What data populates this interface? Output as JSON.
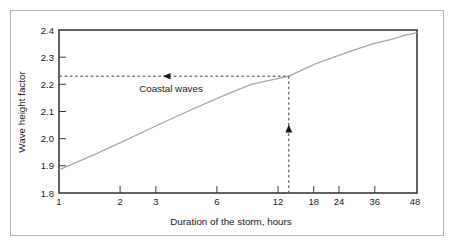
{
  "chart_data": {
    "type": "line",
    "title": "",
    "xlabel": "Duration of the storm, hours",
    "ylabel": "Wave height factor",
    "xscale": "log",
    "xlim": [
      1,
      48
    ],
    "ylim": [
      1.8,
      2.4
    ],
    "grid": false,
    "legend": null,
    "xticks": [
      1,
      2,
      3,
      6,
      12,
      18,
      24,
      36,
      48
    ],
    "xtick_labels": [
      "1",
      "2",
      "3",
      "6",
      "12",
      "18",
      "24",
      "36",
      "48"
    ],
    "yticks": [
      1.8,
      1.9,
      2.0,
      2.1,
      2.2,
      2.3,
      2.4
    ],
    "ytick_labels": [
      "1.8",
      "1.9",
      "2.0",
      "2.1",
      "2.2",
      "2.3",
      "2.4"
    ],
    "series": [
      {
        "name": "Coastal waves",
        "color": "#a8a8a8",
        "x": [
          1,
          1.5,
          2,
          3,
          4,
          6,
          8,
          12,
          16,
          18,
          24,
          30,
          36,
          42,
          48
        ],
        "y": [
          1.885,
          1.945,
          1.99,
          2.055,
          2.1,
          2.16,
          2.2,
          2.23,
          2.275,
          2.29,
          2.325,
          2.35,
          2.365,
          2.38,
          2.39
        ]
      }
    ],
    "annotations": [
      {
        "name": "coastal-waves-label",
        "text": "Coastal waves",
        "x": 3.1,
        "y": 2.195
      },
      {
        "name": "horizontal-guide",
        "style": "dashed-with-left-arrow",
        "y": 2.23,
        "x_from": 1,
        "x_to": 12
      },
      {
        "name": "vertical-guide",
        "style": "dashed-with-up-arrow",
        "x": 12,
        "y_from": 1.8,
        "y_to": 2.23
      }
    ],
    "readout": {
      "duration_hours": 12,
      "wave_height_factor": 2.23
    }
  },
  "colors": {
    "curve": "#a8a8a8",
    "axis": "#3b3b3b",
    "dash": "#3b3b3b",
    "text": "#1a1a1a",
    "outer_border": "#b4b4b4",
    "background": "#ffffff"
  }
}
